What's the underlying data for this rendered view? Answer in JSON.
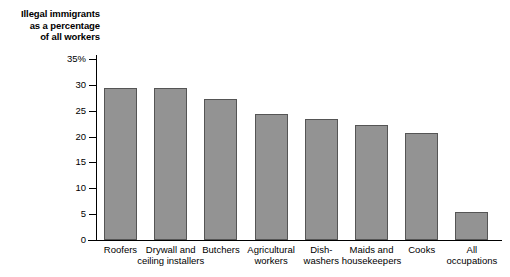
{
  "chart_data": {
    "type": "bar",
    "title": "Illegal immigrants as a percentage of all workers",
    "title_lines": [
      "Illegal immigrants",
      "as a percentage",
      "of all workers"
    ],
    "xlabel": "",
    "ylabel": "",
    "ylim": [
      0,
      35
    ],
    "grid": false,
    "legend": "none",
    "y_ticks": [
      "0",
      "5",
      "10",
      "15",
      "20",
      "25",
      "30",
      "35%"
    ],
    "y_tick_values": [
      0,
      5,
      10,
      15,
      20,
      25,
      30,
      35
    ],
    "categories": [
      "Roofers",
      "Drywall and ceiling installers",
      "Butchers",
      "Agricultural workers",
      "Dish-washers",
      "Maids and housekeepers",
      "Cooks",
      "All occupations"
    ],
    "category_lines": [
      [
        "Roofers"
      ],
      [
        "Drywall and",
        "ceiling installers"
      ],
      [
        "Butchers"
      ],
      [
        "Agricultural",
        "workers"
      ],
      [
        "Dish-",
        "washers"
      ],
      [
        "Maids and",
        "housekeepers"
      ],
      [
        "Cooks"
      ],
      [
        "All",
        "occupations"
      ]
    ],
    "values": [
      29.4,
      29.4,
      27.2,
      24.4,
      23.4,
      22.3,
      20.6,
      5.4
    ],
    "units": "percent",
    "bar_color": "#939393",
    "bar_edge_color": "#555555",
    "axis_color": "#000000",
    "background_color": "#ffffff"
  }
}
